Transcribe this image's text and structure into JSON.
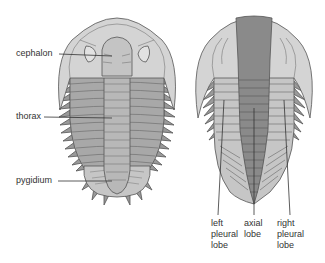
{
  "diagram": {
    "left_figure": {
      "labels": [
        {
          "id": "cephalon",
          "text": "cephalon"
        },
        {
          "id": "thorax",
          "text": "thorax"
        },
        {
          "id": "pygidium",
          "text": "pygidium"
        }
      ]
    },
    "right_figure": {
      "labels": [
        {
          "id": "left-pleural-lobe",
          "lines": [
            "left",
            "pleural",
            "lobe"
          ]
        },
        {
          "id": "axial-lobe",
          "lines": [
            "axial",
            "lobe"
          ]
        },
        {
          "id": "right-pleural-lobe",
          "lines": [
            "right",
            "pleural",
            "lobe"
          ]
        }
      ]
    },
    "colors": {
      "light_gray": "#d4d4d4",
      "mid_gray": "#a8a8a8",
      "dark_gray": "#8a8a8a",
      "outline": "#555555",
      "label_text": "#333333"
    }
  }
}
